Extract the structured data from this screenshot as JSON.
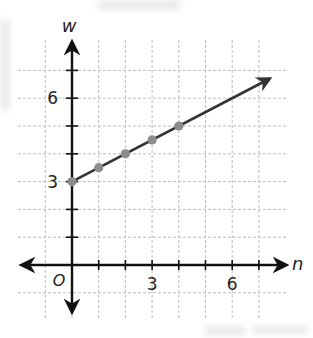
{
  "chart_data": {
    "type": "line",
    "title": "",
    "xlabel": "n",
    "ylabel": "w",
    "origin_label": "O",
    "x_ticks": [
      0,
      1,
      2,
      3,
      4,
      5,
      6,
      7
    ],
    "x_tick_labels": [
      {
        "value": 3,
        "label": "3"
      },
      {
        "value": 6,
        "label": "6"
      }
    ],
    "y_ticks": [
      0,
      1,
      2,
      3,
      4,
      5,
      6,
      7
    ],
    "y_tick_labels": [
      {
        "value": 3,
        "label": "3"
      },
      {
        "value": 6,
        "label": "6"
      }
    ],
    "xlim": [
      -1,
      7.5
    ],
    "ylim": [
      -1,
      7
    ],
    "grid": true,
    "grid_style": "dashed",
    "legend": null,
    "series": [
      {
        "name": "w = 3 + 0.5n",
        "x": [
          0,
          1,
          2,
          3,
          4
        ],
        "y": [
          3,
          3.5,
          4,
          4.5,
          5
        ],
        "markers": true,
        "extends_with_arrow_to": [
          7.4,
          6.7
        ]
      }
    ]
  },
  "colors": {
    "axis": "#111111",
    "grid": "#bdbdbd",
    "line": "#333333",
    "marker": "#8c8c8c"
  }
}
